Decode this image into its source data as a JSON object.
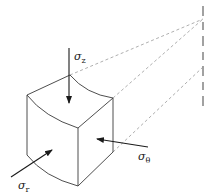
{
  "diagram": {
    "labels": {
      "sigma_z": {
        "symbol": "σ",
        "subscript": "z"
      },
      "sigma_theta": {
        "symbol": "σ",
        "subscript": "θ"
      },
      "sigma_r": {
        "symbol": "σ",
        "subscript": "r"
      }
    },
    "colors": {
      "edge": "#3a3a3a",
      "dashed": "#9a9a9a",
      "arrow": "#1a1a1a",
      "background": "#ffffff"
    }
  }
}
